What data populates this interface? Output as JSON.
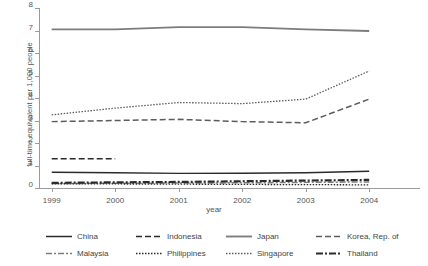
{
  "chart_data": {
    "type": "line",
    "title": "",
    "xlabel": "year",
    "ylabel": "full-time equivalent per 1,000 people",
    "x": [
      1999,
      2000,
      2001,
      2002,
      2003,
      2004
    ],
    "xtick_labels": [
      "1999",
      "2000",
      "2001",
      "2002",
      "2003",
      "2004"
    ],
    "ytick_labels": [
      "0",
      "1",
      "2",
      "3",
      "4",
      "5",
      "6",
      "7",
      "8"
    ],
    "xlim": [
      1998.8,
      2004.8
    ],
    "ylim": [
      0,
      8
    ],
    "grid": false,
    "legend_position": "bottom",
    "series": [
      {
        "name": "China",
        "values": [
          0.7,
          0.68,
          0.65,
          0.66,
          0.68,
          0.74
        ]
      },
      {
        "name": "Indonesia",
        "values": [
          1.3,
          1.3,
          null,
          null,
          null,
          null
        ]
      },
      {
        "name": "Japan",
        "values": [
          7.05,
          7.05,
          7.15,
          7.15,
          7.05,
          6.98
        ]
      },
      {
        "name": "Korea, Rep. of",
        "values": [
          2.95,
          3.0,
          3.05,
          2.95,
          2.9,
          3.95
        ]
      },
      {
        "name": "Malaysia",
        "values": [
          0.2,
          0.21,
          0.22,
          0.23,
          0.25,
          0.27
        ]
      },
      {
        "name": "Philippines",
        "values": [
          0.19,
          0.18,
          0.17,
          0.16,
          0.15,
          0.14
        ]
      },
      {
        "name": "Singapore",
        "values": [
          3.25,
          3.55,
          3.8,
          3.75,
          3.95,
          5.2
        ]
      },
      {
        "name": "Thailand",
        "values": [
          0.23,
          0.25,
          0.27,
          0.3,
          0.33,
          0.36
        ]
      }
    ]
  },
  "legend": {
    "entries": [
      {
        "label": "China",
        "style": "solid-dark"
      },
      {
        "label": "Indonesia",
        "style": "dash-dark"
      },
      {
        "label": "Japan",
        "style": "solid-gray"
      },
      {
        "label": "Korea, Rep. of",
        "style": "dash-gray"
      },
      {
        "label": "Malaysia",
        "style": "dashdot-gray"
      },
      {
        "label": "Philippines",
        "style": "dot-dark"
      },
      {
        "label": "Singapore",
        "style": "dot-gray"
      },
      {
        "label": "Thailand",
        "style": "thick-dashdot"
      }
    ]
  },
  "colors": {
    "dark": "#2b2b2b",
    "gray": "#7d7d7d",
    "mid": "#5c5c5c",
    "axis": "#9b9b9b",
    "text": "#555555"
  }
}
